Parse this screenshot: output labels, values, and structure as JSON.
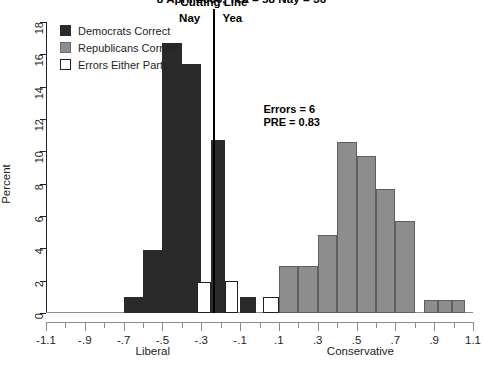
{
  "chart_data": {
    "type": "bar",
    "title": "8 April 2006, Yea = 58  Nay = 36",
    "xlabel": "",
    "ylabel": "Percent",
    "xlim": [
      -1.1,
      1.1
    ],
    "ylim": [
      0,
      18
    ],
    "grid": false,
    "legend_position": "top-left",
    "x_tick_labels": [
      "-1.1",
      "-.9",
      "-.7",
      "-.5",
      "-.3",
      "-.1",
      ".1",
      ".3",
      ".5",
      ".7",
      ".9",
      "1.1"
    ],
    "x_tick_values": [
      -1.1,
      -0.9,
      -0.7,
      -0.5,
      -0.3,
      -0.1,
      0.1,
      0.3,
      0.5,
      0.7,
      0.9,
      1.1
    ],
    "x_minor_step": 0.1,
    "y_tick_labels": [
      "0",
      "2",
      "4",
      "6",
      "8",
      "10",
      "12",
      "14",
      "16",
      "18"
    ],
    "y_tick_values": [
      0,
      2,
      4,
      6,
      8,
      10,
      12,
      14,
      16,
      18
    ],
    "bin_width": 0.1,
    "axis_captions": {
      "left": "Liberal",
      "right": "Conservative"
    },
    "series": [
      {
        "name": "Democrats Correct",
        "color": "#2b2a2a",
        "bins": [
          {
            "x0": -0.7,
            "x1": -0.6,
            "value": 1.0
          },
          {
            "x0": -0.6,
            "x1": -0.5,
            "value": 3.9
          },
          {
            "x0": -0.5,
            "x1": -0.4,
            "value": 16.7
          },
          {
            "x0": -0.4,
            "x1": -0.3,
            "value": 15.4
          },
          {
            "x0": -0.25,
            "x1": -0.18,
            "value": 10.7
          },
          {
            "x0": -0.1,
            "x1": -0.02,
            "value": 1.0
          }
        ]
      },
      {
        "name": "Republicans Correct",
        "color": "#8d8d8d",
        "bins": [
          {
            "x0": 0.1,
            "x1": 0.2,
            "value": 2.9
          },
          {
            "x0": 0.2,
            "x1": 0.3,
            "value": 2.9
          },
          {
            "x0": 0.3,
            "x1": 0.4,
            "value": 4.8
          },
          {
            "x0": 0.4,
            "x1": 0.5,
            "value": 10.6
          },
          {
            "x0": 0.5,
            "x1": 0.6,
            "value": 9.7
          },
          {
            "x0": 0.6,
            "x1": 0.7,
            "value": 7.7
          },
          {
            "x0": 0.7,
            "x1": 0.8,
            "value": 5.7
          },
          {
            "x0": 0.85,
            "x1": 0.92,
            "value": 0.8
          },
          {
            "x0": 0.92,
            "x1": 0.99,
            "value": 0.8
          },
          {
            "x0": 0.99,
            "x1": 1.06,
            "value": 0.8
          }
        ]
      },
      {
        "name": "Errors Either Party",
        "color": "#ffffff",
        "bins": [
          {
            "x0": -0.32,
            "x1": -0.25,
            "value": 1.9
          },
          {
            "x0": -0.18,
            "x1": -0.11,
            "value": 2.0
          },
          {
            "x0": 0.02,
            "x1": 0.1,
            "value": 1.0
          }
        ]
      }
    ],
    "annotations": [
      {
        "name": "cutting-line",
        "label": "Cutting Line",
        "x": -0.235,
        "type": "vline"
      },
      {
        "name": "nay-label",
        "label": "Nay",
        "x": -0.36
      },
      {
        "name": "yea-label",
        "label": "Yea",
        "x": -0.14
      },
      {
        "name": "errors-text",
        "label": "Errors = 6",
        "x": 0.02,
        "y": 13.0
      },
      {
        "name": "pre-text",
        "label": "PRE = 0.83",
        "x": 0.02,
        "y": 12.2
      }
    ]
  },
  "legend": {
    "items": [
      {
        "label": "Democrats Correct",
        "swatch": "dem"
      },
      {
        "label": "Republicans Correct",
        "swatch": "rep"
      },
      {
        "label": "Errors Either Party",
        "swatch": "err"
      }
    ]
  }
}
